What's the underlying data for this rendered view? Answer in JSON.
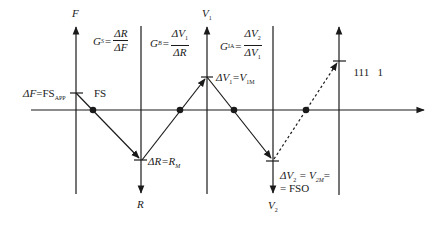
{
  "diagram": {
    "type": "transfer-chain-quadrant-diagram",
    "stroke_color": "#1a1a1a",
    "background": "#ffffff",
    "axes": [
      {
        "id": "F",
        "label": "F",
        "label_sub": "",
        "direction": "up",
        "x": 76
      },
      {
        "id": "R",
        "label": "R",
        "label_sub": "",
        "direction": "down",
        "x": 141
      },
      {
        "id": "V1",
        "label": "V",
        "label_sub": "1",
        "direction": "up",
        "x": 207
      },
      {
        "id": "V2",
        "label": "V",
        "label_sub": "2",
        "direction": "down",
        "x": 273
      },
      {
        "id": "out",
        "label": "",
        "label_sub": "",
        "direction": "up",
        "x": 339
      }
    ],
    "horizontal_axis": {
      "direction": "right",
      "y": 110
    },
    "gains": [
      {
        "name": "G",
        "sub": "S",
        "num": "ΔR",
        "num_sub": "",
        "den": "ΔF",
        "den_sub": ""
      },
      {
        "name": "G",
        "sub": "B",
        "num": "ΔV",
        "num_sub": "1",
        "den": "ΔR",
        "den_sub": ""
      },
      {
        "name": "G",
        "sub": "IA",
        "num": "ΔV",
        "num_sub": "2",
        "den": "ΔV",
        "den_sub": "1"
      }
    ],
    "annotations": {
      "force_fullscale": {
        "lhs": "ΔF",
        "eq": "=FS",
        "sub": "APP"
      },
      "fs_label": "FS",
      "resistance_max": {
        "lhs": "ΔR",
        "eq": "=R",
        "sub": "M"
      },
      "v1_max": {
        "lhs": "ΔV",
        "lhs_sub": "1",
        "eq": "=V",
        "sub": "1M"
      },
      "v2_max_line1": {
        "lhs": "ΔV",
        "lhs_sub": "2",
        "eq": " = V",
        "sub": "2M",
        "tail": "="
      },
      "v2_max_line2": "= FSO",
      "digital_output": "111   1"
    },
    "path_points": {
      "solid": [
        [
          76,
          93
        ],
        [
          93,
          110
        ],
        [
          141,
          160
        ],
        [
          180,
          110
        ],
        [
          207,
          77
        ],
        [
          234,
          110
        ],
        [
          273,
          160
        ]
      ],
      "dotted": [
        [
          273,
          160
        ],
        [
          306,
          110
        ],
        [
          339,
          61
        ]
      ],
      "dots": [
        [
          93,
          110
        ],
        [
          180,
          110
        ],
        [
          234,
          110
        ],
        [
          306,
          110
        ]
      ]
    }
  }
}
